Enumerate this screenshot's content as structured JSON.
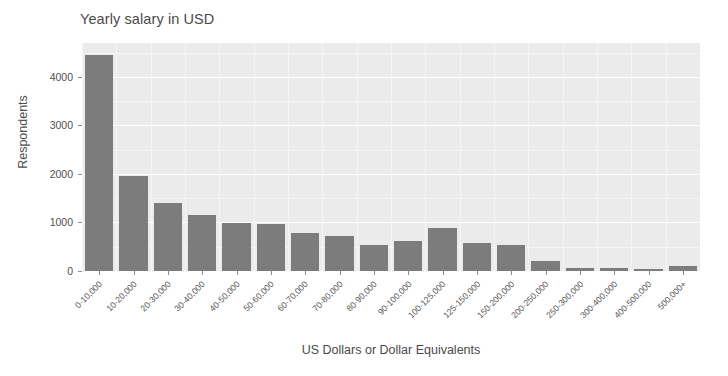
{
  "chart_data": {
    "type": "bar",
    "title": "Yearly salary in USD",
    "xlabel": "US Dollars or Dollar Equivalents",
    "ylabel": "Respondents",
    "grid": true,
    "legend": false,
    "ylim": [
      0,
      4700
    ],
    "yticks": [
      0,
      1000,
      2000,
      3000,
      4000
    ],
    "ytick_labels": [
      "0",
      "1000",
      "2000",
      "3000",
      "4000"
    ],
    "categories": [
      "0-10,000",
      "10-20,000",
      "20-30,000",
      "30-40,000",
      "40-50,000",
      "50-60,000",
      "60-70,000",
      "70-80,000",
      "80-90,000",
      "90-100,000",
      "100-125,000",
      "125-150,000",
      "150-200,000",
      "200-250,000",
      "250-300,000",
      "300-400,000",
      "400-500,000",
      "500,000+"
    ],
    "values": [
      4460,
      1950,
      1410,
      1150,
      990,
      965,
      775,
      720,
      545,
      615,
      885,
      580,
      530,
      215,
      70,
      55,
      35,
      100
    ],
    "bar_color": "#7c7c7c",
    "panel_color": "#ebebeb",
    "gridline_color": "#ffffff",
    "text_color": "#4f4f4f"
  }
}
